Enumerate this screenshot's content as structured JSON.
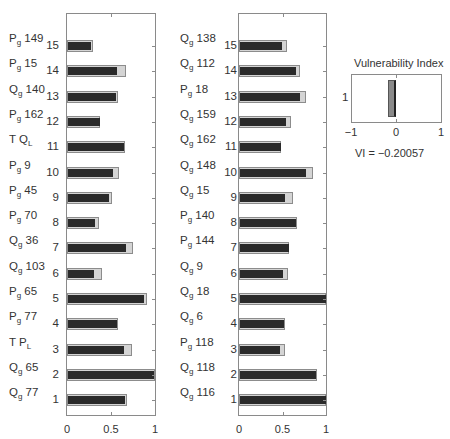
{
  "chart_data": [
    {
      "type": "bar",
      "orientation": "horizontal",
      "title": "",
      "xlabel": "",
      "ylabel": "",
      "xlim": [
        0,
        1
      ],
      "xticks": [
        "0",
        "0.5",
        "1"
      ],
      "grid": false,
      "categories_bottom_to_top": [
        "1",
        "2",
        "3",
        "4",
        "5",
        "6",
        "7",
        "8",
        "9",
        "10",
        "11",
        "12",
        "13",
        "14",
        "15"
      ],
      "row_labels": [
        {
          "num": "1",
          "var": "Q",
          "sub": "g",
          "id": "77"
        },
        {
          "num": "2",
          "var": "Q",
          "sub": "g",
          "id": "65"
        },
        {
          "num": "3",
          "var": "T P",
          "sub": "L",
          "id": ""
        },
        {
          "num": "4",
          "var": "P",
          "sub": "g",
          "id": "77"
        },
        {
          "num": "5",
          "var": "P",
          "sub": "g",
          "id": "65"
        },
        {
          "num": "6",
          "var": "Q",
          "sub": "g",
          "id": "103"
        },
        {
          "num": "7",
          "var": "Q",
          "sub": "g",
          "id": "36"
        },
        {
          "num": "8",
          "var": "P",
          "sub": "g",
          "id": "70"
        },
        {
          "num": "9",
          "var": "P",
          "sub": "g",
          "id": "45"
        },
        {
          "num": "10",
          "var": "P",
          "sub": "g",
          "id": "9"
        },
        {
          "num": "11",
          "var": "T Q",
          "sub": "L",
          "id": ""
        },
        {
          "num": "12",
          "var": "P",
          "sub": "g",
          "id": "162"
        },
        {
          "num": "13",
          "var": "Q",
          "sub": "g",
          "id": "140"
        },
        {
          "num": "14",
          "var": "P",
          "sub": "g",
          "id": "15"
        },
        {
          "num": "15",
          "var": "P",
          "sub": "g",
          "id": "149"
        }
      ],
      "series": [
        {
          "name": "inner (dark)",
          "color": "#2a2a2a",
          "values": [
            0.66,
            0.99,
            0.65,
            0.57,
            0.88,
            0.31,
            0.67,
            0.32,
            0.48,
            0.52,
            0.65,
            0.37,
            0.56,
            0.57,
            0.27
          ]
        },
        {
          "name": "outer (light grey)",
          "color": "#d4d4d4",
          "values": [
            0.68,
            1.0,
            0.74,
            0.58,
            0.91,
            0.4,
            0.75,
            0.36,
            0.51,
            0.59,
            0.66,
            0.37,
            0.58,
            0.67,
            0.3
          ]
        }
      ]
    },
    {
      "type": "bar",
      "orientation": "horizontal",
      "title": "",
      "xlabel": "",
      "ylabel": "",
      "xlim": [
        0,
        1
      ],
      "xticks": [
        "0",
        "0.5",
        "1"
      ],
      "grid": false,
      "categories_bottom_to_top": [
        "1",
        "2",
        "3",
        "4",
        "5",
        "6",
        "7",
        "8",
        "9",
        "10",
        "11",
        "12",
        "13",
        "14",
        "15"
      ],
      "row_labels": [
        {
          "num": "1",
          "var": "Q",
          "sub": "g",
          "id": "116"
        },
        {
          "num": "2",
          "var": "Q",
          "sub": "g",
          "id": "118"
        },
        {
          "num": "3",
          "var": "P",
          "sub": "g",
          "id": "118"
        },
        {
          "num": "4",
          "var": "Q",
          "sub": "g",
          "id": "6"
        },
        {
          "num": "5",
          "var": "Q",
          "sub": "g",
          "id": "18"
        },
        {
          "num": "6",
          "var": "Q",
          "sub": "g",
          "id": "9"
        },
        {
          "num": "7",
          "var": "P",
          "sub": "g",
          "id": "144"
        },
        {
          "num": "8",
          "var": "P",
          "sub": "g",
          "id": "140"
        },
        {
          "num": "9",
          "var": "Q",
          "sub": "g",
          "id": "15"
        },
        {
          "num": "10",
          "var": "Q",
          "sub": "g",
          "id": "148"
        },
        {
          "num": "11",
          "var": "Q",
          "sub": "g",
          "id": "162"
        },
        {
          "num": "12",
          "var": "Q",
          "sub": "g",
          "id": "159"
        },
        {
          "num": "13",
          "var": "P",
          "sub": "g",
          "id": "18"
        },
        {
          "num": "14",
          "var": "Q",
          "sub": "g",
          "id": "112"
        },
        {
          "num": "15",
          "var": "Q",
          "sub": "g",
          "id": "138"
        }
      ],
      "series": [
        {
          "name": "inner (dark)",
          "color": "#2a2a2a",
          "values": [
            1.0,
            0.88,
            0.47,
            0.52,
            1.0,
            0.51,
            0.57,
            0.65,
            0.53,
            0.77,
            0.48,
            0.54,
            0.7,
            0.65,
            0.49
          ]
        },
        {
          "name": "outer (light grey)",
          "color": "#d4d4d4",
          "values": [
            1.0,
            0.9,
            0.53,
            0.53,
            1.0,
            0.56,
            0.58,
            0.67,
            0.62,
            0.85,
            0.48,
            0.6,
            0.77,
            0.7,
            0.55
          ]
        }
      ]
    },
    {
      "type": "bar",
      "orientation": "horizontal",
      "title": "Vulnerability Index",
      "xlim": [
        -1,
        1
      ],
      "xticks": [
        "−1",
        "0",
        "1"
      ],
      "yticks": [
        "1"
      ],
      "categories": [
        "1"
      ],
      "values": [
        -0.20057
      ],
      "bar_color": "#8a8a8a",
      "annotation": "VI = −0.20057"
    }
  ],
  "vi_panel": {
    "title": "Vulnerability Index",
    "ytick": "1",
    "xticks": [
      "−1",
      "0",
      "1"
    ],
    "value_text": "VI =  −0.20057"
  }
}
